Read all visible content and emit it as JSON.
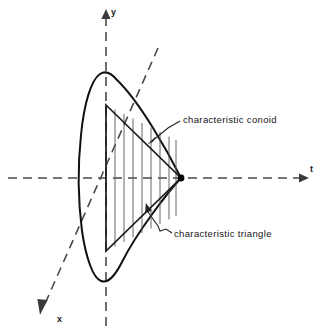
{
  "figure": {
    "background_color": "#ffffff",
    "line_color": "#111111",
    "axis_color": "#4a4a4a",
    "hatch_color": "#555555",
    "axes": [
      {
        "name": "y-axis",
        "label": "y",
        "direction": "up",
        "style": "dashed"
      },
      {
        "name": "t-axis",
        "label": "t",
        "direction": "right",
        "style": "dashed"
      },
      {
        "name": "x-axis",
        "label": "x",
        "direction": "down-left",
        "style": "dashed"
      }
    ],
    "annotations": [
      {
        "name": "characteristic-conoid",
        "text": "characteristic conoid",
        "leader": "arrow pointing down-left to conoid surface"
      },
      {
        "name": "characteristic-triangle",
        "text": "characteristic triangle",
        "leader": "arrow pointing up-left into hatched triangle"
      }
    ],
    "shapes": [
      {
        "name": "characteristic-conoid",
        "kind": "closed curve",
        "description": "Teardrop / lens shaped conoid opening leftward from apex on t-axis"
      },
      {
        "name": "characteristic-triangle",
        "kind": "triangle",
        "description": "Triangle with vertical left base and apex at origin-side point on t-axis, filled with vertical hatching"
      }
    ],
    "hatching": {
      "name": "triangle-hatching",
      "orientation": "vertical",
      "line_count": 8
    },
    "apex": {
      "name": "apex-point",
      "marker": "filled dot",
      "on_axis": "t"
    }
  }
}
